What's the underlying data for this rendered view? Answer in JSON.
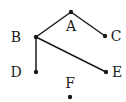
{
  "diagram": {
    "type": "graph",
    "nodes": [
      {
        "id": "A",
        "label": "A",
        "x": 71,
        "y": 12,
        "lx": 71,
        "ly": 31,
        "anchor": "middle"
      },
      {
        "id": "B",
        "label": "B",
        "x": 36,
        "y": 37,
        "lx": 16,
        "ly": 42,
        "anchor": "middle"
      },
      {
        "id": "C",
        "label": "C",
        "x": 105,
        "y": 36,
        "lx": 116,
        "ly": 41,
        "anchor": "middle"
      },
      {
        "id": "D",
        "label": "D",
        "x": 36,
        "y": 72,
        "lx": 16,
        "ly": 77,
        "anchor": "middle"
      },
      {
        "id": "E",
        "label": "E",
        "x": 106,
        "y": 72,
        "lx": 117,
        "ly": 77,
        "anchor": "middle"
      },
      {
        "id": "F",
        "label": "F",
        "x": 70,
        "y": 97,
        "lx": 70,
        "ly": 88,
        "anchor": "middle"
      }
    ],
    "edges": [
      {
        "from": "A",
        "to": "B"
      },
      {
        "from": "A",
        "to": "C"
      },
      {
        "from": "B",
        "to": "D"
      },
      {
        "from": "B",
        "to": "E"
      }
    ],
    "colors": {
      "edge": "#1a1a1a",
      "node": "#1a1a1a"
    }
  }
}
